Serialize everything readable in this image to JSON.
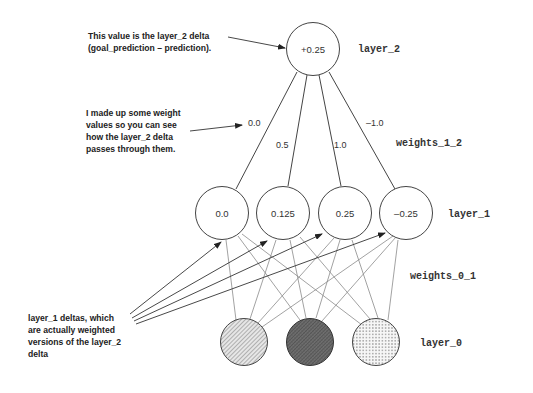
{
  "diagram": {
    "layers": {
      "layer_2": {
        "label": "layer_2",
        "nodes": [
          {
            "value": "+0.25"
          }
        ]
      },
      "weights_1_2": {
        "label": "weights_1_2",
        "values": [
          "0.0",
          "0.5",
          "1.0",
          "–1.0"
        ]
      },
      "layer_1": {
        "label": "layer_1",
        "nodes": [
          {
            "value": "0.0"
          },
          {
            "value": "0.125"
          },
          {
            "value": "0.25"
          },
          {
            "value": "–0.25"
          }
        ]
      },
      "weights_0_1": {
        "label": "weights_0_1"
      },
      "layer_0": {
        "label": "layer_0",
        "nodes": [
          {
            "fill": "diagonal-hatch"
          },
          {
            "fill": "dark-crosshatch"
          },
          {
            "fill": "dotted"
          }
        ]
      }
    },
    "annotations": {
      "layer2_delta": {
        "lines": [
          "This value is the layer_2 delta",
          "(goal_prediction – prediction)."
        ]
      },
      "weights_note": {
        "lines": [
          "I made up some weight",
          "values so you can see",
          "how the layer_2 delta",
          "passes through them."
        ]
      },
      "layer1_deltas": {
        "lines": [
          "layer_1 deltas, which",
          "are actually weighted",
          "versions of the layer_2",
          "delta"
        ]
      }
    },
    "colors": {
      "stroke": "#444444",
      "text": "#222222",
      "hatch_light": "#9a9a9a",
      "hatch_dark": "#5a5a5a"
    }
  }
}
